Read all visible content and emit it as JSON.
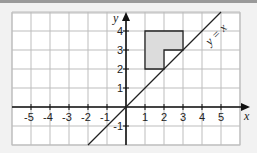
{
  "diagram": {
    "x_axis": {
      "label": "x",
      "min": -6,
      "max": 6,
      "ticks": [
        "-5",
        "-4",
        "-3",
        "-2",
        "-1",
        "1",
        "2",
        "3",
        "4",
        "5"
      ]
    },
    "y_axis": {
      "label": "y",
      "min": -2,
      "max": 5,
      "ticks": [
        "4",
        "3",
        "2",
        "1",
        "-1"
      ]
    },
    "line_label": "y = x",
    "shape": {
      "description": "L-shaped polygon",
      "vertices": [
        [
          1,
          2
        ],
        [
          1,
          4
        ],
        [
          3,
          4
        ],
        [
          3,
          3
        ],
        [
          2,
          3
        ],
        [
          2,
          2
        ]
      ],
      "fill": "#dcdcdc"
    },
    "colors": {
      "grid": "#bdbdbd",
      "axis": "#111111",
      "background": "#ffffff"
    }
  }
}
